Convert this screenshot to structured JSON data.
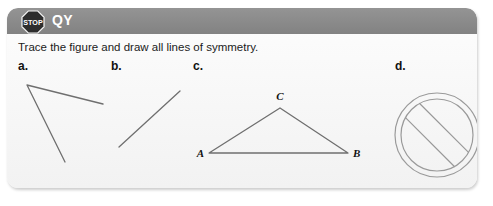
{
  "card": {
    "header": {
      "icon": "stop-sign-icon",
      "icon_text": "STOP",
      "title": "QY",
      "bar_color": "#8b8b8b",
      "title_color": "#ffffff"
    },
    "instruction": "Trace the figure and draw all lines of symmetry.",
    "background_color": "#f7f7f7",
    "line_color": "#6b6b6b"
  },
  "figures": [
    {
      "label": "a.",
      "name": "open-angle-figure",
      "type": "angle",
      "vertex": [
        27,
        85
      ],
      "rays": [
        [
          103,
          104
        ],
        [
          65,
          162
        ]
      ]
    },
    {
      "label": "b.",
      "name": "line-segment-figure",
      "type": "segment",
      "from": [
        119,
        147
      ],
      "to": [
        180,
        91
      ]
    },
    {
      "label": "c.",
      "name": "triangle-figure",
      "type": "triangle",
      "vertices": {
        "A": [
          209,
          153
        ],
        "B": [
          348,
          153
        ],
        "C": [
          280,
          108
        ]
      },
      "vertex_labels": [
        "A",
        "B",
        "C"
      ]
    },
    {
      "label": "d.",
      "name": "prohibition-sign-figure",
      "type": "no-symbol",
      "center": [
        437,
        135
      ],
      "radius": 42
    }
  ]
}
